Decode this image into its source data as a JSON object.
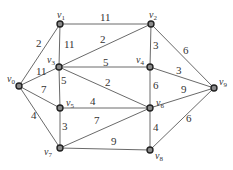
{
  "graph": {
    "nodes": [
      {
        "id": "v0",
        "name": "v",
        "sub": "0"
      },
      {
        "id": "v1",
        "name": "v",
        "sub": "1"
      },
      {
        "id": "v2",
        "name": "v",
        "sub": "2"
      },
      {
        "id": "v3",
        "name": "v",
        "sub": "3"
      },
      {
        "id": "v4",
        "name": "v",
        "sub": "4"
      },
      {
        "id": "v5",
        "name": "v",
        "sub": "5"
      },
      {
        "id": "v6",
        "name": "v",
        "sub": "6"
      },
      {
        "id": "v7",
        "name": "v",
        "sub": "7"
      },
      {
        "id": "v8",
        "name": "v",
        "sub": "8"
      },
      {
        "id": "v9",
        "name": "v",
        "sub": "9"
      }
    ],
    "edges": [
      {
        "from": "v0",
        "to": "v1",
        "weight": "2"
      },
      {
        "from": "v1",
        "to": "v2",
        "weight": "11"
      },
      {
        "from": "v1",
        "to": "v3",
        "weight": "11"
      },
      {
        "from": "v0",
        "to": "v3",
        "weight": "11"
      },
      {
        "from": "v3",
        "to": "v2",
        "weight": "2"
      },
      {
        "from": "v3",
        "to": "v4",
        "weight": "5"
      },
      {
        "from": "v3",
        "to": "v5",
        "weight": "5"
      },
      {
        "from": "v3",
        "to": "v6",
        "weight": "2"
      },
      {
        "from": "v2",
        "to": "v4",
        "weight": "3"
      },
      {
        "from": "v2",
        "to": "v9",
        "weight": "6"
      },
      {
        "from": "v4",
        "to": "v9",
        "weight": "3"
      },
      {
        "from": "v4",
        "to": "v6",
        "weight": "6"
      },
      {
        "from": "v0",
        "to": "v5",
        "weight": "7"
      },
      {
        "from": "v5",
        "to": "v6",
        "weight": "4"
      },
      {
        "from": "v0",
        "to": "v7",
        "weight": "4"
      },
      {
        "from": "v5",
        "to": "v7",
        "weight": "3"
      },
      {
        "from": "v7",
        "to": "v6",
        "weight": "7"
      },
      {
        "from": "v7",
        "to": "v8",
        "weight": "9"
      },
      {
        "from": "v6",
        "to": "v9",
        "weight": "9"
      },
      {
        "from": "v6",
        "to": "v8",
        "weight": "4"
      },
      {
        "from": "v8",
        "to": "v9",
        "weight": "6"
      }
    ]
  }
}
